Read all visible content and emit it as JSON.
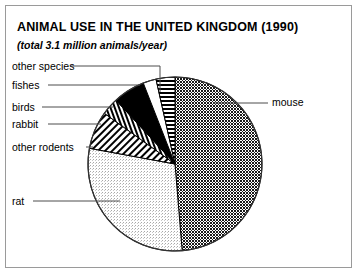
{
  "figure": {
    "title": "ANIMAL USE IN THE UNITED KINGDOM (1990)",
    "subtitle": "(total 3.1 million animals/year)",
    "frame_color": "#9a9a9a",
    "background": "#ffffff"
  },
  "chart_data": {
    "type": "pie",
    "title": "ANIMAL USE IN THE UNITED KINGDOM (1990)",
    "subtitle": "(total 3.1 million animals/year)",
    "total_label": "total 3.1 million animals/year",
    "total_value": 3.1,
    "total_units": "million animals/year",
    "xlabel": "",
    "ylabel": "",
    "legend": "callout-labels",
    "grid": false,
    "start_angle_deg": 90,
    "direction": "clockwise",
    "categories": [
      "mouse",
      "rat",
      "other rodents",
      "rabbit",
      "birds",
      "fishes",
      "other species"
    ],
    "values": [
      50.0,
      30.0,
      7.2,
      3.3,
      6.1,
      2.5,
      3.6
    ],
    "units": "percent",
    "slices": [
      {
        "label": "mouse",
        "percent": 50.0,
        "angle_deg": 180.0,
        "pattern": "dark-dots",
        "color": "#2b2b2b"
      },
      {
        "label": "rat",
        "percent": 30.0,
        "angle_deg": 108.0,
        "pattern": "light-dots",
        "color": "#d9d9d9"
      },
      {
        "label": "other rodents",
        "percent": 7.2,
        "angle_deg": 26.0,
        "pattern": "diagonal-hatch",
        "color": "#000000"
      },
      {
        "label": "rabbit",
        "percent": 3.3,
        "angle_deg": 12.0,
        "pattern": "ladder-checker",
        "color": "#000000"
      },
      {
        "label": "birds",
        "percent": 6.1,
        "angle_deg": 22.0,
        "pattern": "solid-black",
        "color": "#000000"
      },
      {
        "label": "fishes",
        "percent": 2.5,
        "angle_deg": 9.0,
        "pattern": "white",
        "color": "#ffffff"
      },
      {
        "label": "other species",
        "percent": 3.6,
        "angle_deg": 13.0,
        "pattern": "horizontal-lines",
        "color": "#000000"
      }
    ],
    "callouts": [
      {
        "label": "other species",
        "side": "left"
      },
      {
        "label": "fishes",
        "side": "left"
      },
      {
        "label": "birds",
        "side": "left"
      },
      {
        "label": "rabbit",
        "side": "left"
      },
      {
        "label": "other rodents",
        "side": "left"
      },
      {
        "label": "rat",
        "side": "left"
      },
      {
        "label": "mouse",
        "side": "right"
      }
    ]
  }
}
